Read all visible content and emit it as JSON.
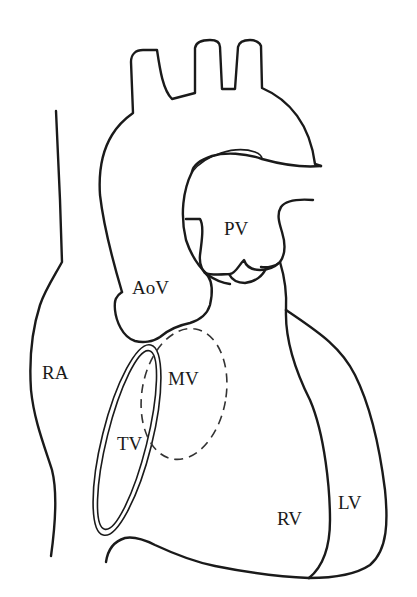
{
  "diagram": {
    "line_color": "#1a1a1a",
    "background": "#ffffff",
    "labels": {
      "pv": "PV",
      "aov": "AoV",
      "ra": "RA",
      "mv": "MV",
      "tv": "TV",
      "rv": "RV",
      "lv": "LV"
    },
    "structures": [
      {
        "id": "aortic-arch",
        "label": ""
      },
      {
        "id": "pulmonary-valve",
        "label": "PV"
      },
      {
        "id": "aortic-valve",
        "label": "AoV"
      },
      {
        "id": "right-atrium",
        "label": "RA"
      },
      {
        "id": "mitral-valve",
        "label": "MV",
        "style": "dashed"
      },
      {
        "id": "tricuspid-valve",
        "label": "TV",
        "style": "double-ellipse"
      },
      {
        "id": "right-ventricle",
        "label": "RV"
      },
      {
        "id": "left-ventricle",
        "label": "LV"
      }
    ]
  }
}
